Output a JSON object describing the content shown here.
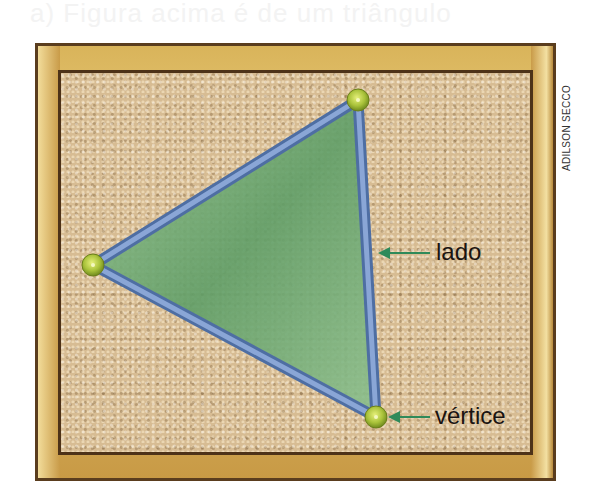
{
  "header": {
    "faded_text": "a) Figura acima é de um triângulo"
  },
  "credit": "ADILSON SECCO",
  "figure": {
    "shape": "triangle",
    "vertices": [
      [
        358,
        100
      ],
      [
        93,
        265
      ],
      [
        376,
        417
      ]
    ],
    "colors": {
      "fill": "#7fb383",
      "edge": "#6f8fbf",
      "pin": "#a6c23a",
      "arrow": "#2e8a5a",
      "cork": "#d7bc93",
      "frame": "#d9b45a"
    }
  },
  "labels": {
    "side": "lado",
    "vertex": "vértice"
  }
}
